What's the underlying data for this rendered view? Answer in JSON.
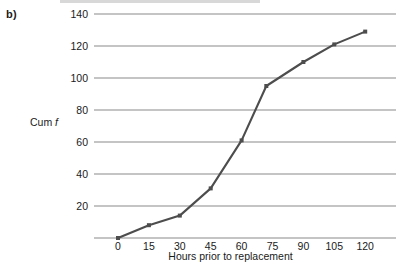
{
  "figure": {
    "panel_label": "b)",
    "background_color": "#ffffff",
    "line_color": "#4d4d4d",
    "grid_color": "#8a8a8a",
    "axis_color": "#8a8a8a",
    "text_color": "#1a1a1a"
  },
  "chart_data": {
    "type": "line",
    "title": "",
    "subtitle": "",
    "xlabel": "Hours prior to replacement",
    "ylabel": "Cum f",
    "ylabel_parts": {
      "prefix": "Cum ",
      "italic": "f"
    },
    "x": [
      0,
      15,
      30,
      45,
      60,
      72,
      90,
      105,
      120
    ],
    "values": [
      0,
      8,
      14,
      31,
      61,
      95,
      110,
      121,
      129
    ],
    "series": [
      {
        "name": "Cumulative frequency",
        "values": [
          0,
          8,
          14,
          31,
          61,
          95,
          110,
          121,
          129
        ]
      }
    ],
    "xticks": [
      0,
      15,
      30,
      45,
      60,
      75,
      90,
      105,
      120
    ],
    "xtick_labels": [
      "0",
      "15",
      "30",
      "45",
      "60",
      "75",
      "90",
      "105",
      "120"
    ],
    "yticks": [
      20,
      40,
      60,
      80,
      100,
      120,
      140
    ],
    "ytick_labels": [
      "20",
      "40",
      "60",
      "80",
      "100",
      "120",
      "140"
    ],
    "xlim": [
      -8,
      128
    ],
    "ylim": [
      0,
      140
    ],
    "grid": true,
    "grid_axis": "y",
    "legend": false,
    "legend_position": "none",
    "markers": true,
    "marker_style": "square"
  }
}
